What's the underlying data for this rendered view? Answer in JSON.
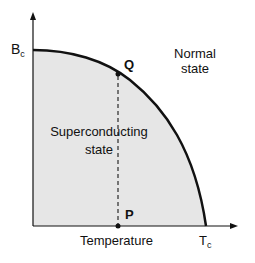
{
  "diagram": {
    "type": "phase-diagram",
    "axes": {
      "y_label_main": "B",
      "y_label_sub": "c",
      "x_label": "Temperature",
      "x_end_main": "T",
      "x_end_sub": "c"
    },
    "regions": {
      "superconducting_line1": "Superconducting",
      "superconducting_line2": "state",
      "normal_line1": "Normal",
      "normal_line2": "state"
    },
    "points": {
      "q_label": "Q",
      "p_label": "P"
    },
    "colors": {
      "fill": "#e6e6e6",
      "line": "#111111"
    }
  }
}
